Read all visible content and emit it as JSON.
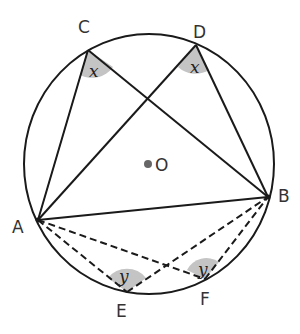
{
  "diagram": {
    "colors": {
      "stroke": "#1a1a1a",
      "angle_fill": "#c4c4c4",
      "label": "#333333",
      "center_dot": "#666666"
    },
    "circle": {
      "cx": 149,
      "cy": 164,
      "rx": 125,
      "ry": 130
    },
    "center": {
      "label": "O",
      "x": 148,
      "y": 164
    },
    "points": {
      "A": {
        "label": "A",
        "x": 38,
        "y": 220
      },
      "B": {
        "label": "B",
        "x": 268,
        "y": 197
      },
      "C": {
        "label": "C",
        "x": 88,
        "y": 50
      },
      "D": {
        "label": "D",
        "x": 196,
        "y": 45
      },
      "E": {
        "label": "E",
        "x": 127,
        "y": 292
      },
      "F": {
        "label": "F",
        "x": 205,
        "y": 279
      }
    },
    "solid_segments": [
      "AB",
      "AC",
      "CB",
      "AD",
      "DB"
    ],
    "dashed_segments": [
      "AE",
      "EB",
      "AF",
      "FB"
    ],
    "angles": [
      {
        "vertex": "C",
        "label": "x"
      },
      {
        "vertex": "D",
        "label": "x"
      },
      {
        "vertex": "E",
        "label": "y"
      },
      {
        "vertex": "F",
        "label": "y"
      }
    ]
  }
}
